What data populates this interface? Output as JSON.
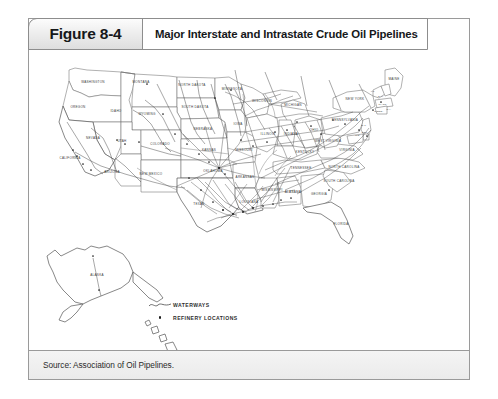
{
  "figure": {
    "number_label": "Figure 8-4",
    "title": "Major Interstate and Intrastate Crude Oil Pipelines",
    "source": "Source: Association of Oil Pipelines."
  },
  "legend": {
    "items": [
      {
        "symbol": "wavy-line",
        "label": "WATERWAYS"
      },
      {
        "symbol": "dot",
        "label": "REFINERY LOCATIONS"
      }
    ]
  },
  "map": {
    "type": "choropleth-outline-with-network",
    "region": "United States",
    "state_labels": [
      {
        "name": "WASHINGTON",
        "x": 64,
        "y": 33
      },
      {
        "name": "OREGON",
        "x": 49,
        "y": 58
      },
      {
        "name": "IDAHO",
        "x": 87,
        "y": 62
      },
      {
        "name": "MONTANA",
        "x": 112,
        "y": 33
      },
      {
        "name": "NORTH DAKOTA",
        "x": 163,
        "y": 36
      },
      {
        "name": "SOUTH DAKOTA",
        "x": 166,
        "y": 58
      },
      {
        "name": "WYOMING",
        "x": 118,
        "y": 65
      },
      {
        "name": "NEBRASKA",
        "x": 174,
        "y": 80
      },
      {
        "name": "NEVADA",
        "x": 64,
        "y": 89
      },
      {
        "name": "UTAH",
        "x": 93,
        "y": 92
      },
      {
        "name": "COLORADO",
        "x": 131,
        "y": 95
      },
      {
        "name": "KANSAS",
        "x": 180,
        "y": 101
      },
      {
        "name": "CALIFORNIA",
        "x": 41,
        "y": 109
      },
      {
        "name": "ARIZONA",
        "x": 83,
        "y": 123
      },
      {
        "name": "NEW MEXICO",
        "x": 122,
        "y": 125
      },
      {
        "name": "OKLAHOMA",
        "x": 184,
        "y": 122
      },
      {
        "name": "TEXAS",
        "x": 170,
        "y": 155
      },
      {
        "name": "MINNESOTA",
        "x": 203,
        "y": 40
      },
      {
        "name": "IOWA",
        "x": 209,
        "y": 75
      },
      {
        "name": "MISSOURI",
        "x": 215,
        "y": 101
      },
      {
        "name": "ARKANSAS",
        "x": 216,
        "y": 128
      },
      {
        "name": "LOUISIANA",
        "x": 220,
        "y": 153
      },
      {
        "name": "WISCONSIN",
        "x": 233,
        "y": 52
      },
      {
        "name": "ILLINOIS",
        "x": 239,
        "y": 85
      },
      {
        "name": "MISSISSIPPI",
        "x": 243,
        "y": 141
      },
      {
        "name": "MICHIGAN",
        "x": 264,
        "y": 56
      },
      {
        "name": "INDIANA",
        "x": 262,
        "y": 85
      },
      {
        "name": "KENTUCKY",
        "x": 276,
        "y": 103
      },
      {
        "name": "TENNESSEE",
        "x": 272,
        "y": 119
      },
      {
        "name": "ALABAMA",
        "x": 264,
        "y": 143
      },
      {
        "name": "OHIO",
        "x": 285,
        "y": 81
      },
      {
        "name": "GEORGIA",
        "x": 290,
        "y": 145
      },
      {
        "name": "FLORIDA",
        "x": 312,
        "y": 175
      },
      {
        "name": "SOUTH CAROLINA",
        "x": 310,
        "y": 132
      },
      {
        "name": "NORTH CAROLINA",
        "x": 315,
        "y": 118
      },
      {
        "name": "VIRGINIA",
        "x": 318,
        "y": 101
      },
      {
        "name": "WEST VIRGINIA",
        "x": 299,
        "y": 92
      },
      {
        "name": "PENNSYLVANIA",
        "x": 316,
        "y": 71
      },
      {
        "name": "NEW YORK",
        "x": 326,
        "y": 50
      },
      {
        "name": "MAINE",
        "x": 365,
        "y": 30
      },
      {
        "name": "ALASKA",
        "x": 68,
        "y": 226
      }
    ],
    "small_state_labels": [
      {
        "name": "VT.",
        "x": 344,
        "y": 42
      },
      {
        "name": "N.H.",
        "x": 352,
        "y": 47
      },
      {
        "name": "MASS.",
        "x": 354,
        "y": 55
      },
      {
        "name": "CONN.",
        "x": 350,
        "y": 62
      },
      {
        "name": "R.I.",
        "x": 360,
        "y": 60
      },
      {
        "name": "N.J.",
        "x": 335,
        "y": 76
      },
      {
        "name": "DEL.",
        "x": 336,
        "y": 83
      },
      {
        "name": "MD.",
        "x": 329,
        "y": 86
      }
    ],
    "insets": [
      {
        "name": "alaska",
        "label": "ALASKA"
      },
      {
        "name": "hawaii",
        "label": ""
      }
    ]
  }
}
